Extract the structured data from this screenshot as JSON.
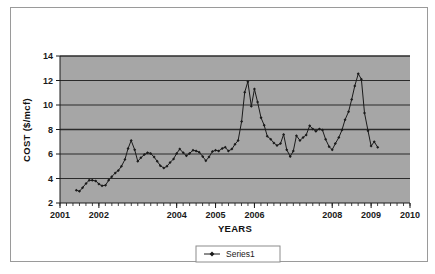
{
  "chart_data": {
    "type": "line",
    "title": "",
    "xlabel": "YEARS",
    "ylabel": "COST ($/mcf)",
    "xlim": [
      2001,
      2010
    ],
    "ylim": [
      2,
      14
    ],
    "yticks": [
      2,
      4,
      6,
      8,
      10,
      12,
      14
    ],
    "ytick_labels": [
      "2",
      "4",
      "6",
      "8",
      "10",
      "12",
      "14"
    ],
    "xtick_labels": [
      "2001",
      "2002",
      "2004",
      "2005",
      "2006",
      "2008",
      "2009",
      "2010"
    ],
    "xtick_values": [
      2001,
      2002,
      2004,
      2005,
      2006,
      2008,
      2009,
      2010
    ],
    "grid": true,
    "grid_axis": "y",
    "plot_background": "#a6a6a6",
    "line_color": "#1a1a1a",
    "marker": "diamond",
    "legend": {
      "position": "bottom",
      "entries": [
        "Series1"
      ]
    },
    "series": [
      {
        "name": "Series1",
        "x": [
          2001.42,
          2001.5,
          2001.58,
          2001.67,
          2001.75,
          2001.83,
          2001.92,
          2002.0,
          2002.08,
          2002.17,
          2002.25,
          2002.33,
          2002.42,
          2002.5,
          2002.58,
          2002.67,
          2002.75,
          2002.83,
          2002.92,
          2003.0,
          2003.08,
          2003.17,
          2003.25,
          2003.33,
          2003.42,
          2003.5,
          2003.58,
          2003.67,
          2003.75,
          2003.83,
          2003.92,
          2004.0,
          2004.08,
          2004.17,
          2004.25,
          2004.33,
          2004.42,
          2004.5,
          2004.58,
          2004.67,
          2004.75,
          2004.83,
          2004.92,
          2005.0,
          2005.08,
          2005.17,
          2005.25,
          2005.33,
          2005.42,
          2005.5,
          2005.58,
          2005.67,
          2005.75,
          2005.83,
          2005.92,
          2006.0,
          2006.08,
          2006.17,
          2006.25,
          2006.33,
          2006.42,
          2006.5,
          2006.58,
          2006.67,
          2006.75,
          2006.83,
          2006.92,
          2007.0,
          2007.08,
          2007.17,
          2007.25,
          2007.33,
          2007.42,
          2007.5,
          2007.58,
          2007.67,
          2007.75,
          2007.83,
          2007.92,
          2008.0,
          2008.08,
          2008.17,
          2008.25,
          2008.33,
          2008.42,
          2008.5,
          2008.58,
          2008.67,
          2008.75,
          2008.83,
          2008.92,
          2009.0,
          2009.08,
          2009.17
        ],
        "y": [
          3.05,
          2.95,
          3.25,
          3.6,
          3.85,
          3.85,
          3.8,
          3.55,
          3.4,
          3.45,
          3.85,
          4.15,
          4.45,
          4.65,
          5.0,
          5.55,
          6.45,
          7.1,
          6.35,
          5.4,
          5.7,
          5.95,
          6.1,
          6.05,
          5.75,
          5.4,
          5.05,
          4.85,
          5.0,
          5.3,
          5.6,
          6.05,
          6.4,
          6.1,
          5.85,
          6.05,
          6.3,
          6.25,
          6.15,
          5.8,
          5.45,
          5.75,
          6.2,
          6.3,
          6.25,
          6.45,
          6.55,
          6.25,
          6.4,
          6.8,
          7.1,
          8.65,
          11.05,
          11.9,
          9.9,
          11.3,
          10.25,
          8.95,
          8.35,
          7.45,
          7.2,
          6.9,
          6.7,
          6.85,
          7.6,
          6.35,
          5.8,
          6.25,
          7.5,
          7.1,
          7.35,
          7.55,
          8.3,
          8.05,
          7.85,
          8.05,
          7.95,
          7.2,
          6.6,
          6.35,
          6.85,
          7.35,
          7.95,
          8.8,
          9.45,
          10.45,
          11.55,
          12.55,
          12.1,
          9.35,
          7.9,
          6.65,
          7.0,
          6.55
        ]
      }
    ]
  },
  "legend_marker": {
    "icon": "line-with-diamond-marker"
  }
}
